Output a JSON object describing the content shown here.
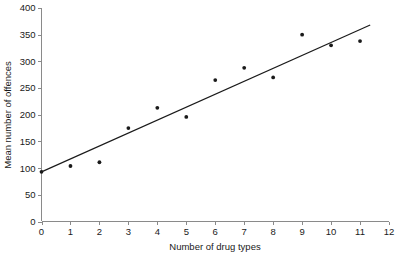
{
  "chart_data": {
    "type": "scatter",
    "title": "",
    "xlabel": "Number of drug types",
    "ylabel": "Mean number of offences",
    "xlim": [
      0,
      12
    ],
    "ylim": [
      0,
      400
    ],
    "xticks": [
      0,
      1,
      2,
      3,
      4,
      5,
      6,
      7,
      8,
      9,
      10,
      11,
      12
    ],
    "yticks": [
      0,
      50,
      100,
      150,
      200,
      250,
      300,
      350,
      400
    ],
    "xtick_labels": [
      "0",
      "1",
      "2",
      "3",
      "4",
      "5",
      "6",
      "7",
      "8",
      "9",
      "10",
      "11",
      "12"
    ],
    "ytick_labels": [
      "0",
      "50",
      "100",
      "150",
      "200",
      "250",
      "300",
      "350",
      "400"
    ],
    "grid": false,
    "legend": null,
    "x": [
      0,
      1,
      2,
      3,
      4,
      5,
      6,
      7,
      8,
      9,
      10,
      11
    ],
    "y": [
      93,
      104,
      111,
      175,
      213,
      196,
      265,
      288,
      270,
      350,
      330,
      338
    ],
    "series": [
      {
        "name": "Mean number of offences",
        "marker": "circle",
        "color": "#1a1a1a",
        "points": [
          {
            "x": 0,
            "y": 93
          },
          {
            "x": 1,
            "y": 104
          },
          {
            "x": 2,
            "y": 111
          },
          {
            "x": 3,
            "y": 175
          },
          {
            "x": 4,
            "y": 213
          },
          {
            "x": 5,
            "y": 196
          },
          {
            "x": 6,
            "y": 265
          },
          {
            "x": 7,
            "y": 288
          },
          {
            "x": 8,
            "y": 270
          },
          {
            "x": 9,
            "y": 350
          },
          {
            "x": 10,
            "y": 330
          },
          {
            "x": 11,
            "y": 338
          }
        ]
      }
    ],
    "trendline": {
      "name": "linear-fit",
      "color": "#1a1a1a",
      "x_start": 0,
      "y_start": 93,
      "x_end": 11.35,
      "y_end": 368
    },
    "colors": {
      "background": "#ffffff",
      "axis": "#8a8a8a",
      "text": "#1a1a1a",
      "marker": "#1a1a1a",
      "line": "#1a1a1a"
    }
  }
}
